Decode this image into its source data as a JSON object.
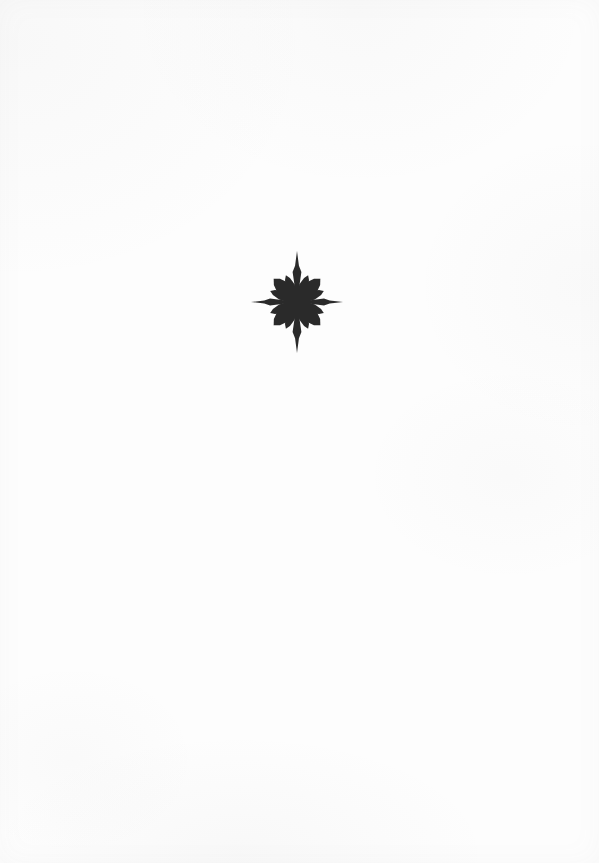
{
  "page": {
    "width": 599,
    "height": 863,
    "background_color": "#fdfdfd",
    "kind": "blank-book-page",
    "text_content": "",
    "paper_tone": "off-white scanned paper with faint grey scan mottling at the edges"
  },
  "ornament": {
    "name": "compass-rose-star-ornament",
    "description": "Printed black decorative star / compass-rose typographic fleuron centered in the upper-middle of an otherwise blank page",
    "ink_color": "#2b2b2b",
    "ink_color_soft": "#3a3a3a",
    "center_x": 297,
    "center_y": 302,
    "bounds": {
      "left": 251,
      "top": 251,
      "right": 345,
      "bottom": 353,
      "width": 94,
      "height": 102
    },
    "ray_counts": {
      "cardinal_needles": 4,
      "diagonal_arms": 4,
      "secondary_rays": 8,
      "total_rays": 16
    },
    "geometry": {
      "vertical_spike_length": 51,
      "horizontal_spike_length": 46,
      "diagonal_arm_length": 33,
      "secondary_ray_length": 29,
      "vertical_bulge_offset": 30,
      "vertical_bulge_half_width": 4.4,
      "horizontal_bulge_offset": 27,
      "horizontal_bulge_half_width": 3.6,
      "diagonal_arm_half_width": 7.5,
      "secondary_ray_half_width": 4.6,
      "hub_radius": 4.2,
      "blur_px": 0.55
    }
  }
}
